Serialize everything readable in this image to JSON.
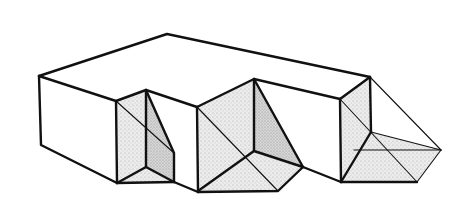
{
  "figure": {
    "width": 466,
    "height": 199,
    "colors": {
      "line": "#111111",
      "background": "#ffffff",
      "stipple_light": "#e4e4e4",
      "stipple_dark": "#cfcfcf"
    }
  }
}
